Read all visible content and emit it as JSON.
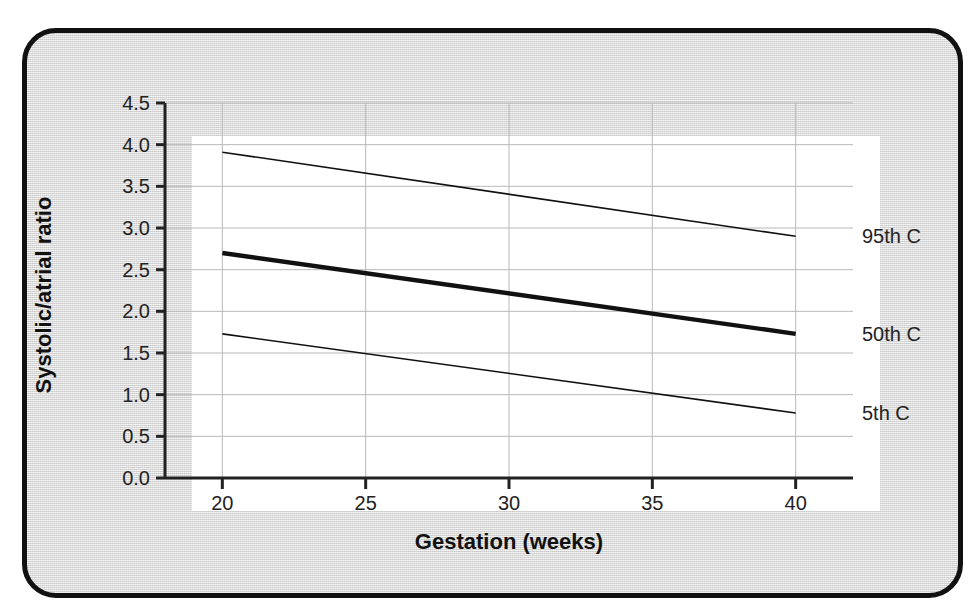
{
  "chart_data": {
    "type": "line",
    "title": "",
    "subtitle": "",
    "xlabel": "Gestation (weeks)",
    "ylabel": "Systolic/atrial ratio",
    "xlim": [
      18,
      42
    ],
    "ylim": [
      0.0,
      4.5
    ],
    "xticks": [
      20,
      25,
      30,
      35,
      40
    ],
    "xtick_labels": [
      "20",
      "25",
      "30",
      "35",
      "40"
    ],
    "yticks": [
      0.0,
      0.5,
      1.0,
      1.5,
      2.0,
      2.5,
      3.0,
      3.5,
      4.0,
      4.5
    ],
    "ytick_labels": [
      "0.0",
      "0.5",
      "1.0",
      "1.5",
      "2.0",
      "2.5",
      "3.0",
      "3.5",
      "4.0",
      "4.5"
    ],
    "grid": true,
    "grid_color": "#b8b8b8",
    "legend_position": "right-inline-annotations",
    "x": [
      20,
      40
    ],
    "series": [
      {
        "name": "95th C",
        "label": "95th C",
        "values": [
          3.91,
          2.9
        ],
        "color": "#111111",
        "linewidth": 1.6,
        "label_y": 2.9
      },
      {
        "name": "50th C",
        "label": "50th C",
        "values": [
          2.7,
          1.73
        ],
        "color": "#111111",
        "linewidth": 4.4,
        "label_y": 1.73
      },
      {
        "name": "5th C",
        "label": "5th C",
        "values": [
          1.73,
          0.78
        ],
        "color": "#111111",
        "linewidth": 1.6,
        "label_y": 0.78
      }
    ]
  },
  "figure": {
    "background_color": "#dcdcdc",
    "plot_background_color": "#ffffff",
    "border_color": "#111111",
    "axis_color": "#222222"
  }
}
